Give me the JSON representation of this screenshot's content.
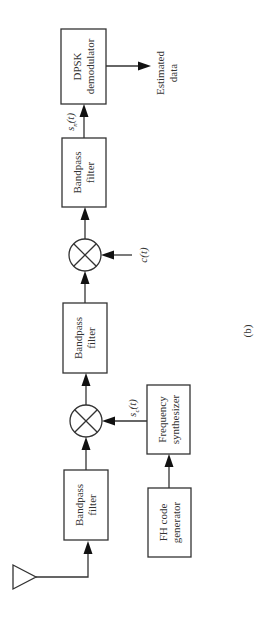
{
  "diagram": {
    "caption": "(b)",
    "blocks": {
      "dpsk": {
        "line1": "DPSK",
        "line2": "demodulator"
      },
      "bpf_out": {
        "line1": "Bandpass",
        "line2": "filter"
      },
      "bpf_mid": {
        "line1": "Bandpass",
        "line2": "filter"
      },
      "bpf_in": {
        "line1": "Bandpass",
        "line2": "filter"
      },
      "freq_synth": {
        "line1": "Frequency",
        "line2": "synthesizer"
      },
      "fh_gen": {
        "line1": "FH code",
        "line2": "generator"
      }
    },
    "signals": {
      "sn": {
        "base": "s",
        "sub": "n",
        "arg": "(t)"
      },
      "sc": {
        "base": "s",
        "sub": "c",
        "arg": "(t)"
      },
      "ct": {
        "base": "c",
        "arg": "(t)"
      }
    },
    "output": {
      "line1": "Estimated",
      "line2": "data"
    },
    "mixers": [
      "multiplier-1",
      "multiplier-2"
    ],
    "antenna": "receive-antenna"
  }
}
